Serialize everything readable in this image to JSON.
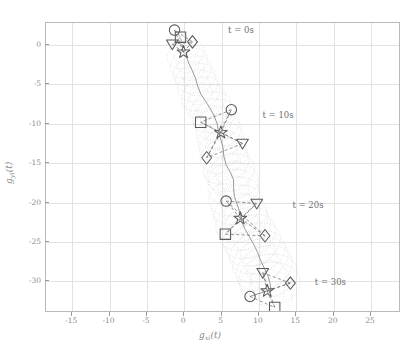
{
  "figure": {
    "title": "",
    "background": "#ffffff",
    "frame_color": "#b9b9b9",
    "grid_color": "#e2e2e2"
  },
  "axes": {
    "xlabel": "g",
    "xlabel_sub": "x",
    "xlabel_sub2": "i",
    "xlabel_tail": "(t)",
    "ylabel": "g",
    "ylabel_sub": "y",
    "ylabel_sub2": "i",
    "ylabel_tail": "(t)",
    "xticks": [
      -15,
      -10,
      -5,
      0,
      5,
      10,
      15,
      20,
      25
    ],
    "yticks": [
      0,
      -5,
      -10,
      -15,
      -20,
      -25,
      -30
    ],
    "xlim": [
      -18.5,
      29.0
    ],
    "ylim": [
      -34.0,
      2.8
    ]
  },
  "annotations": [
    {
      "text": "t = 0s",
      "x": 6.0,
      "y": 1.6
    },
    {
      "text": "t = 10s",
      "x": 10.6,
      "y": -9.1
    },
    {
      "text": "t = 20s",
      "x": 14.6,
      "y": -20.6
    },
    {
      "text": "t = 30s",
      "x": 17.6,
      "y": -30.3
    }
  ],
  "chart_data": {
    "type": "scatter",
    "title": "",
    "xlabel": "g_{x_i}(t)",
    "ylabel": "g_{y_i}(t)",
    "xlim": [
      -18.5,
      29.0
    ],
    "ylim": [
      -34.0,
      2.8
    ],
    "xticks": [
      -15,
      -10,
      -5,
      0,
      5,
      10,
      15,
      20,
      25
    ],
    "yticks": [
      0,
      -5,
      -10,
      -15,
      -20,
      -25,
      -30
    ],
    "grid": true,
    "legend": "none",
    "marker_color": "#5a5a5a",
    "trajectory_color": "#8d8d8d",
    "ellipse_color": "#cfcfcf",
    "link_color": "#6a6a6a",
    "series": [
      {
        "name": "leader-trajectory",
        "style": "solid-line",
        "points": [
          [
            0.2,
            -1.2
          ],
          [
            0.6,
            -2.3
          ],
          [
            1.1,
            -3.3
          ],
          [
            1.5,
            -4.2
          ],
          [
            1.8,
            -5.2
          ],
          [
            2.2,
            -6.2
          ],
          [
            2.9,
            -7.2
          ],
          [
            3.5,
            -8.1
          ],
          [
            4.0,
            -9.0
          ],
          [
            4.4,
            -10.0
          ],
          [
            4.6,
            -11.0
          ],
          [
            4.9,
            -12.0
          ],
          [
            5.2,
            -13.1
          ],
          [
            5.3,
            -14.1
          ],
          [
            5.6,
            -15.2
          ],
          [
            6.2,
            -16.2
          ],
          [
            6.6,
            -17.1
          ],
          [
            6.6,
            -18.1
          ],
          [
            6.7,
            -19.2
          ],
          [
            7.1,
            -20.3
          ],
          [
            7.5,
            -21.4
          ],
          [
            7.7,
            -22.4
          ],
          [
            8.1,
            -23.3
          ],
          [
            8.7,
            -24.3
          ],
          [
            9.3,
            -25.3
          ],
          [
            9.8,
            -26.3
          ],
          [
            10.2,
            -27.3
          ],
          [
            10.7,
            -28.3
          ],
          [
            11.2,
            -29.3
          ],
          [
            11.5,
            -30.3
          ],
          [
            11.6,
            -31.2
          ]
        ]
      },
      {
        "name": "formation-t0",
        "time_label": "t = 0s",
        "markers": [
          {
            "shape": "circle",
            "x": -1.3,
            "y": 1.9
          },
          {
            "shape": "square",
            "x": -0.5,
            "y": 1.0
          },
          {
            "shape": "triangle",
            "x": -1.6,
            "y": 0.1
          },
          {
            "shape": "diamond",
            "x": 1.1,
            "y": 0.4
          },
          {
            "shape": "star",
            "x": -0.1,
            "y": -0.9
          }
        ]
      },
      {
        "name": "formation-t10",
        "time_label": "t = 10s",
        "markers": [
          {
            "shape": "circle",
            "x": 6.3,
            "y": -8.2
          },
          {
            "shape": "square",
            "x": 2.2,
            "y": -9.8
          },
          {
            "shape": "star",
            "x": 4.9,
            "y": -11.1
          },
          {
            "shape": "triangle",
            "x": 7.8,
            "y": -12.5
          },
          {
            "shape": "diamond",
            "x": 3.0,
            "y": -14.3
          }
        ]
      },
      {
        "name": "formation-t20",
        "time_label": "t = 20s",
        "markers": [
          {
            "shape": "circle",
            "x": 5.6,
            "y": -19.8
          },
          {
            "shape": "triangle",
            "x": 9.7,
            "y": -20.1
          },
          {
            "shape": "star",
            "x": 7.5,
            "y": -22.0
          },
          {
            "shape": "square",
            "x": 5.5,
            "y": -24.0
          },
          {
            "shape": "diamond",
            "x": 10.8,
            "y": -24.2
          }
        ]
      },
      {
        "name": "formation-t30",
        "time_label": "t = 30s",
        "markers": [
          {
            "shape": "triangle",
            "x": 10.5,
            "y": -28.9
          },
          {
            "shape": "diamond",
            "x": 14.2,
            "y": -30.2
          },
          {
            "shape": "star",
            "x": 11.1,
            "y": -31.2
          },
          {
            "shape": "circle",
            "x": 8.8,
            "y": -31.9
          },
          {
            "shape": "square",
            "x": 12.1,
            "y": -33.3
          }
        ]
      }
    ],
    "uncertainty_tube": {
      "description": "overlapping dotted ellipses along the trajectory",
      "count": 31,
      "rx": 3.4,
      "ry": 2.3
    }
  }
}
